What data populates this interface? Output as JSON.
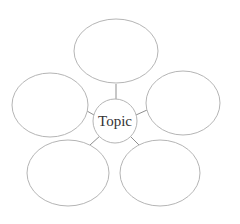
{
  "diagram": {
    "type": "concept-web",
    "center": {
      "label": "Topic",
      "cx": 115,
      "cy": 121,
      "r": 22
    },
    "nodes": [
      {
        "id": "top",
        "label": "",
        "cx": 116,
        "cy": 51,
        "rx": 42,
        "ry": 32
      },
      {
        "id": "left",
        "label": "",
        "cx": 50,
        "cy": 105,
        "rx": 38,
        "ry": 32
      },
      {
        "id": "right",
        "label": "",
        "cx": 183,
        "cy": 103,
        "rx": 37,
        "ry": 32
      },
      {
        "id": "bottom-left",
        "label": "",
        "cx": 68,
        "cy": 173,
        "rx": 41,
        "ry": 33
      },
      {
        "id": "bottom-right",
        "label": "",
        "cx": 160,
        "cy": 173,
        "rx": 40,
        "ry": 33
      }
    ],
    "stroke_color": "#b5b5b5",
    "line_color": "#8f8f8f"
  }
}
